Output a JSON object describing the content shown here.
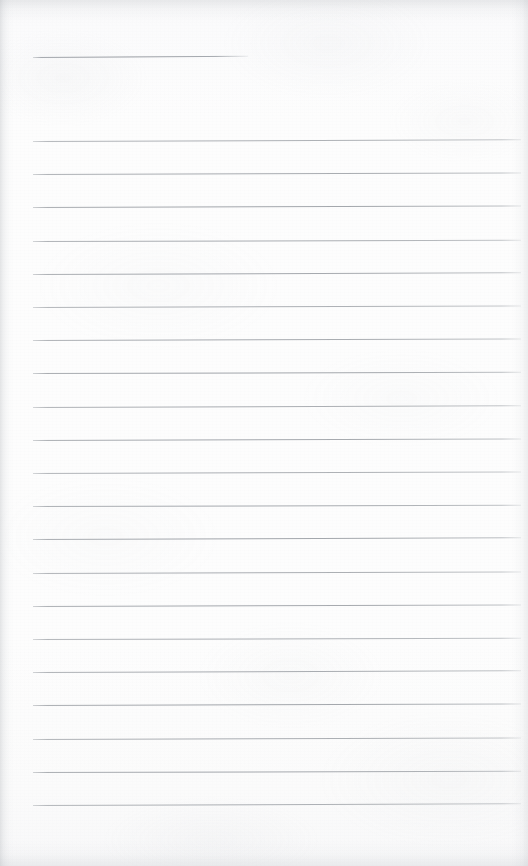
{
  "document": {
    "type": "scanned-lined-paper",
    "title": "Blank Ruled Page",
    "description": "Blank lined notebook page scan with no handwritten or printed content",
    "page_width": 528,
    "page_height": 866,
    "paper_color": "#fdfdfd",
    "rule_color": "#9ca0a6",
    "content_text": ""
  },
  "ruling": {
    "header_rule": {
      "name": "header-rule",
      "x_start": 33,
      "x_end": 248,
      "y": 57,
      "length": 215,
      "slant_deg": -0.35
    },
    "body_rules": {
      "count": 21,
      "x_start": 33,
      "x_end": 521,
      "length": 488,
      "first_y": 141,
      "spacing": 33.2,
      "slant_deg": -0.18,
      "y_positions": [
        141,
        174.2,
        207.4,
        240.6,
        273.8,
        307,
        340.2,
        373.4,
        406.6,
        439.8,
        473,
        506.2,
        539.4,
        572.6,
        605.8,
        639,
        672.2,
        705.4,
        738.6,
        771.8,
        805
      ]
    }
  },
  "margins": {
    "left_margin": 33,
    "right_margin": 7,
    "top_margin": 57,
    "bottom_margin": 61
  },
  "scan_artifacts": {
    "left_edge_shadow": true,
    "right_edge_shadow": true,
    "top_edge_shadow": true,
    "bottom_edge_shadow": true,
    "paper_texture": true,
    "grain": true
  }
}
